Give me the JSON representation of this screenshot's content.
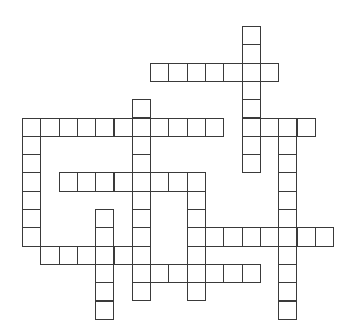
{
  "puzzle": {
    "type": "crossword-grid",
    "title": "Blank Crossword Puzzle Grid",
    "background_color": "#ffffff",
    "cell_border_color": "#3a3a3a",
    "cell_fill_color": "#ffffff",
    "cell_size_px": 18.3,
    "origin": {
      "x": 22,
      "y": 26
    },
    "columns": 18,
    "rows": 16,
    "total_cells": 111,
    "letters_filled": 0,
    "entries": [
      {
        "id": "a1",
        "direction": "down",
        "row": 0,
        "col": 12,
        "length": 6,
        "label": ""
      },
      {
        "id": "a2",
        "direction": "across",
        "row": 2,
        "col": 7,
        "length": 7,
        "label": ""
      },
      {
        "id": "a3",
        "direction": "down",
        "row": 4,
        "col": 6,
        "length": 10,
        "label": ""
      },
      {
        "id": "a4",
        "direction": "across",
        "row": 5,
        "col": 0,
        "length": 11,
        "label": ""
      },
      {
        "id": "a5",
        "direction": "down",
        "row": 5,
        "col": 0,
        "length": 6,
        "label": ""
      },
      {
        "id": "a6",
        "direction": "down",
        "row": 5,
        "col": 14,
        "length": 11,
        "label": ""
      },
      {
        "id": "a7",
        "direction": "across",
        "row": 6,
        "col": 12,
        "length": 4,
        "label": ""
      },
      {
        "id": "a8",
        "direction": "across",
        "row": 8,
        "col": 2,
        "length": 8,
        "label": ""
      },
      {
        "id": "a9",
        "direction": "down",
        "row": 8,
        "col": 9,
        "length": 7,
        "label": ""
      },
      {
        "id": "a10",
        "direction": "down",
        "row": 10,
        "col": 4,
        "length": 6,
        "label": ""
      },
      {
        "id": "a11",
        "direction": "across",
        "row": 11,
        "col": 9,
        "length": 8,
        "label": ""
      },
      {
        "id": "a12",
        "direction": "across",
        "row": 12,
        "col": 1,
        "length": 5,
        "label": ""
      },
      {
        "id": "a13",
        "direction": "across",
        "row": 13,
        "col": 7,
        "length": 6,
        "label": ""
      }
    ],
    "cells": [
      [
        0,
        12
      ],
      [
        1,
        12
      ],
      [
        2,
        7
      ],
      [
        2,
        8
      ],
      [
        2,
        9
      ],
      [
        2,
        10
      ],
      [
        2,
        11
      ],
      [
        2,
        12
      ],
      [
        2,
        13
      ],
      [
        3,
        12
      ],
      [
        4,
        12
      ],
      [
        4,
        6
      ],
      [
        5,
        0
      ],
      [
        5,
        1
      ],
      [
        5,
        2
      ],
      [
        5,
        3
      ],
      [
        5,
        4
      ],
      [
        5,
        5
      ],
      [
        5,
        6
      ],
      [
        5,
        7
      ],
      [
        5,
        8
      ],
      [
        5,
        9
      ],
      [
        5,
        10
      ],
      [
        5,
        12
      ],
      [
        5,
        13
      ],
      [
        5,
        14
      ],
      [
        5,
        15
      ],
      [
        6,
        0
      ],
      [
        6,
        6
      ],
      [
        6,
        12
      ],
      [
        6,
        14
      ],
      [
        7,
        0
      ],
      [
        7,
        6
      ],
      [
        7,
        12
      ],
      [
        7,
        14
      ],
      [
        8,
        0
      ],
      [
        8,
        2
      ],
      [
        8,
        3
      ],
      [
        8,
        4
      ],
      [
        8,
        5
      ],
      [
        8,
        6
      ],
      [
        8,
        7
      ],
      [
        8,
        8
      ],
      [
        8,
        9
      ],
      [
        8,
        14
      ],
      [
        9,
        0
      ],
      [
        9,
        6
      ],
      [
        9,
        9
      ],
      [
        9,
        14
      ],
      [
        10,
        0
      ],
      [
        10,
        4
      ],
      [
        10,
        6
      ],
      [
        10,
        9
      ],
      [
        10,
        14
      ],
      [
        11,
        0
      ],
      [
        11,
        4
      ],
      [
        11,
        6
      ],
      [
        11,
        9
      ],
      [
        11,
        10
      ],
      [
        11,
        11
      ],
      [
        11,
        12
      ],
      [
        11,
        13
      ],
      [
        11,
        14
      ],
      [
        11,
        15
      ],
      [
        11,
        16
      ],
      [
        12,
        1
      ],
      [
        12,
        2
      ],
      [
        12,
        3
      ],
      [
        12,
        4
      ],
      [
        12,
        5
      ],
      [
        12,
        6
      ],
      [
        12,
        9
      ],
      [
        12,
        14
      ],
      [
        13,
        4
      ],
      [
        13,
        6
      ],
      [
        13,
        7
      ],
      [
        13,
        8
      ],
      [
        13,
        9
      ],
      [
        13,
        10
      ],
      [
        13,
        11
      ],
      [
        13,
        12
      ],
      [
        13,
        14
      ],
      [
        14,
        4
      ],
      [
        14,
        6
      ],
      [
        14,
        9
      ],
      [
        14,
        14
      ],
      [
        15,
        4
      ],
      [
        15,
        14
      ]
    ]
  }
}
